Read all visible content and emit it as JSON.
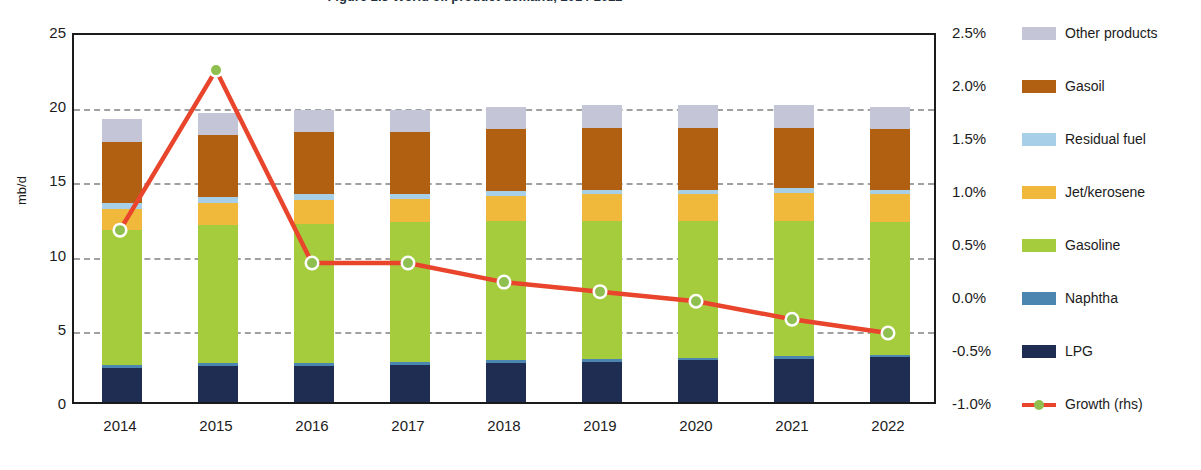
{
  "title": "Figure 2.3  World oil product demand, 2014-2022",
  "axes": {
    "left_title": "mb/d",
    "left_ticks": [
      "25",
      "20",
      "15",
      "10",
      "5",
      "0"
    ],
    "right_ticks": [
      "2.5%",
      "2.0%",
      "1.5%",
      "1.0%",
      "0.5%",
      "0.0%",
      "-0.5%",
      "-1.0%"
    ],
    "x_ticks": [
      "2014",
      "2015",
      "2016",
      "2017",
      "2018",
      "2019",
      "2020",
      "2021",
      "2022"
    ]
  },
  "legend": [
    {
      "label": "Other products",
      "color": "#c5c5d8",
      "type": "swatch"
    },
    {
      "label": "Gasoil",
      "color": "#b06010",
      "type": "swatch"
    },
    {
      "label": "Residual fuel",
      "color": "#a8cfe8",
      "type": "swatch"
    },
    {
      "label": "Jet/kerosene",
      "color": "#f0b93c",
      "type": "swatch"
    },
    {
      "label": "Gasoline",
      "color": "#a5cc3d",
      "type": "swatch"
    },
    {
      "label": "Naphtha",
      "color": "#4a86b0",
      "type": "swatch"
    },
    {
      "label": "LPG",
      "color": "#1f2d52",
      "type": "swatch"
    },
    {
      "label": "Growth (rhs)",
      "color": "#e8452c",
      "type": "line"
    }
  ],
  "colors": {
    "other_products": "#c5c5d8",
    "gasoil": "#b06010",
    "residual_fuel": "#a8cfe8",
    "jet_kerosene": "#f0b93c",
    "gasoline": "#a5cc3d",
    "naphtha": "#4a86b0",
    "lpg": "#1f2d52",
    "growth_line": "#e8452c",
    "growth_marker": "#8fbf4e",
    "grid": "#a0a0a0",
    "frame": "#1b1b1b"
  },
  "chart_data": {
    "type": "bar",
    "title": "Figure 2.3  World oil product demand, 2014-2022",
    "xlabel": "",
    "ylabel": "mb/d",
    "y2label": "",
    "ylim": [
      0,
      25
    ],
    "y2lim": [
      -1.0,
      2.5
    ],
    "grid": true,
    "legend_position": "right",
    "categories": [
      "2014",
      "2015",
      "2016",
      "2017",
      "2018",
      "2019",
      "2020",
      "2021",
      "2022"
    ],
    "stacked": true,
    "series": [
      {
        "name": "LPG",
        "color": "#1f2d52",
        "values": [
          2.3,
          2.4,
          2.4,
          2.5,
          2.6,
          2.7,
          2.8,
          2.9,
          3.0
        ]
      },
      {
        "name": "Naphtha",
        "color": "#4a86b0",
        "values": [
          0.2,
          0.2,
          0.2,
          0.2,
          0.2,
          0.2,
          0.2,
          0.2,
          0.2
        ]
      },
      {
        "name": "Gasoline",
        "color": "#a5cc3d",
        "values": [
          9.1,
          9.3,
          9.4,
          9.4,
          9.4,
          9.3,
          9.2,
          9.1,
          8.9
        ]
      },
      {
        "name": "Jet/kerosene",
        "color": "#f0b93c",
        "values": [
          1.4,
          1.5,
          1.6,
          1.6,
          1.7,
          1.8,
          1.8,
          1.9,
          1.9
        ]
      },
      {
        "name": "Residual fuel",
        "color": "#a8cfe8",
        "values": [
          0.4,
          0.4,
          0.4,
          0.3,
          0.3,
          0.3,
          0.3,
          0.3,
          0.3
        ]
      },
      {
        "name": "Gasoil",
        "color": "#b06010",
        "values": [
          4.1,
          4.2,
          4.2,
          4.2,
          4.2,
          4.2,
          4.2,
          4.1,
          4.1
        ]
      },
      {
        "name": "Other products",
        "color": "#c5c5d8",
        "values": [
          1.6,
          1.5,
          1.5,
          1.5,
          1.5,
          1.5,
          1.5,
          1.5,
          1.5
        ]
      }
    ],
    "totals": [
      19.1,
      19.5,
      19.7,
      19.7,
      19.9,
      20.0,
      20.0,
      20.0,
      19.9
    ],
    "growth_series": {
      "name": "Growth (rhs)",
      "axis": "right",
      "unit": "%",
      "color": "#e8452c",
      "marker_color": "#8fbf4e",
      "values": [
        0.64,
        2.15,
        0.33,
        0.33,
        0.15,
        0.06,
        -0.03,
        -0.2,
        -0.33
      ]
    }
  }
}
